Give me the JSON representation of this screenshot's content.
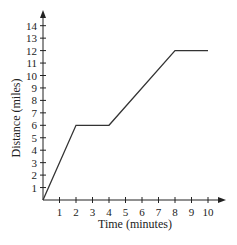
{
  "chart_data": {
    "type": "line",
    "title": "",
    "xlabel": "Time (minutes)",
    "ylabel": "Distance (miles)",
    "xlim": [
      0,
      10
    ],
    "ylim": [
      0,
      14
    ],
    "x_ticks": [
      1,
      2,
      3,
      4,
      5,
      6,
      7,
      8,
      9,
      10
    ],
    "y_ticks": [
      1,
      2,
      3,
      4,
      5,
      6,
      7,
      8,
      9,
      10,
      11,
      12,
      13,
      14
    ],
    "grid": false,
    "legend": null,
    "series": [
      {
        "name": "Distance",
        "x": [
          0,
          2,
          4,
          8,
          10
        ],
        "y": [
          0,
          6,
          6,
          12,
          12
        ]
      }
    ]
  },
  "colors": {
    "axis": "#222222",
    "line": "#333333"
  }
}
